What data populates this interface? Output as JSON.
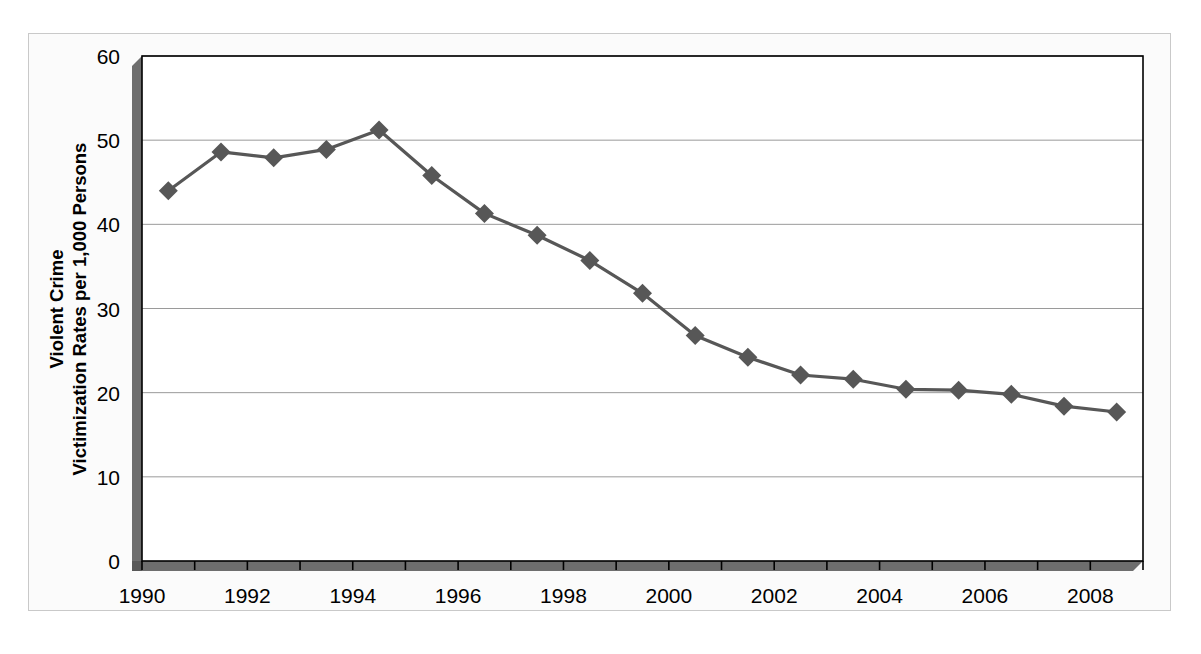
{
  "chart_data": {
    "type": "line",
    "title": "",
    "subtitle": "",
    "xlabel": "",
    "ylabel": "Violent Crime Victimization Rates per 1,000 Persons",
    "ylabel_line1": "Violent Crime",
    "ylabel_line2": "Victimization Rates per 1,000 Persons",
    "x": [
      1990,
      1991,
      1992,
      1993,
      1994,
      1995,
      1996,
      1997,
      1998,
      1999,
      2000,
      2001,
      2002,
      2003,
      2004,
      2005,
      2006,
      2007,
      2008
    ],
    "values": [
      44.0,
      48.6,
      47.9,
      48.9,
      51.2,
      45.8,
      41.3,
      38.7,
      35.7,
      31.8,
      26.8,
      24.2,
      22.1,
      21.6,
      20.4,
      20.3,
      19.8,
      18.4,
      17.7
    ],
    "series": [
      {
        "name": "Violent Crime Victimization Rate",
        "values": [
          44.0,
          48.6,
          47.9,
          48.9,
          51.2,
          45.8,
          41.3,
          38.7,
          35.7,
          31.8,
          26.8,
          24.2,
          22.1,
          21.6,
          20.4,
          20.3,
          19.8,
          18.4,
          17.7
        ]
      }
    ],
    "xlim": [
      1990,
      2009
    ],
    "ylim": [
      0,
      60
    ],
    "ytick_labels": [
      "0",
      "10",
      "20",
      "30",
      "40",
      "50",
      "60"
    ],
    "yticks": [
      0,
      10,
      20,
      30,
      40,
      50,
      60
    ],
    "xtick_labels": [
      "1990",
      "1992",
      "1994",
      "1996",
      "1998",
      "2000",
      "2002",
      "2004",
      "2006",
      "2008"
    ],
    "xticks": [
      1990,
      1992,
      1994,
      1996,
      1998,
      2000,
      2002,
      2004,
      2006,
      2008
    ],
    "xtick_minor": [
      1991,
      1993,
      1995,
      1997,
      1999,
      2001,
      2003,
      2005,
      2007,
      2009
    ],
    "grid": "horizontal",
    "legend": "none",
    "marker": "diamond",
    "series_color": "#575757",
    "gridline_color": "#9a9a9a",
    "axis_color": "#000000",
    "axis_shadow_color": "#6e6e6e",
    "plot_background": "#ffffff",
    "chart_background": "#fbfbfb"
  }
}
